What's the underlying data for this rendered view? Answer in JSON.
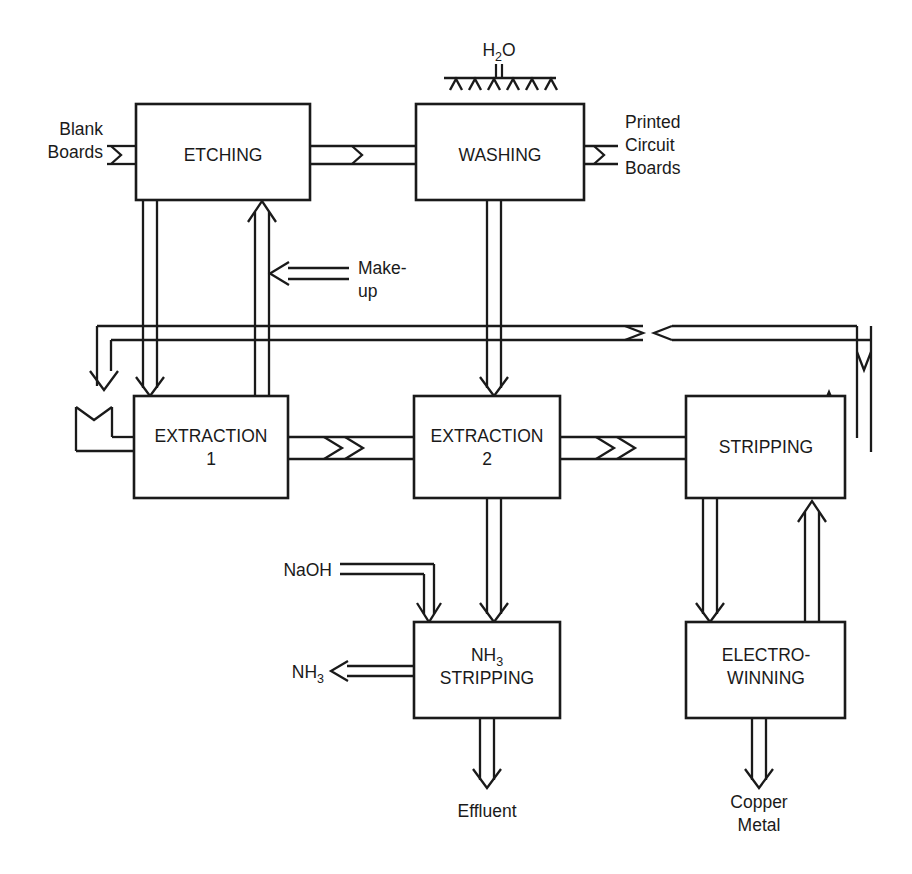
{
  "diagram": {
    "line_color": "#1a1a1a",
    "background_color": "#ffffff"
  },
  "units": [
    {
      "id": "etching",
      "label": "ETCHING"
    },
    {
      "id": "washing",
      "label": "WASHING"
    },
    {
      "id": "extraction1",
      "label_line1": "EXTRACTION",
      "label_line2": "1"
    },
    {
      "id": "extraction2",
      "label_line1": "EXTRACTION",
      "label_line2": "2"
    },
    {
      "id": "stripping",
      "label": "STRIPPING"
    },
    {
      "id": "nh3_stripping",
      "label_line1_main": "NH",
      "label_line1_sub": "3",
      "label_line2": "STRIPPING"
    },
    {
      "id": "electrowinning",
      "label_line1": "ELECTRO-",
      "label_line2": "WINNING"
    }
  ],
  "streams": [
    {
      "id": "blank_boards",
      "line1": "Blank",
      "line2": "Boards"
    },
    {
      "id": "printed_boards",
      "line1": "Printed",
      "line2": "Circuit",
      "line3": "Boards"
    },
    {
      "id": "water_feed",
      "main": "H",
      "sub": "2",
      "tail": "O"
    },
    {
      "id": "makeup",
      "line1": "Make-",
      "line2": "up"
    },
    {
      "id": "naoh",
      "label": "NaOH"
    },
    {
      "id": "ammonia_vent",
      "main": "NH",
      "sub": "3"
    },
    {
      "id": "effluent",
      "label": "Effluent"
    },
    {
      "id": "copper_product",
      "line1": "Copper",
      "line2": "Metal"
    }
  ]
}
